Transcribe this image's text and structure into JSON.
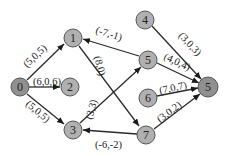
{
  "diagram": {
    "type": "directed-graph",
    "colors": {
      "node_fill": "#b0b0b0",
      "node_fill_highlight": "#909090",
      "edge": "#2a2a2a",
      "background": "#ffffff"
    },
    "nodes": [
      {
        "id": "n0",
        "label": "0",
        "x": 20,
        "y": 87,
        "highlight": true
      },
      {
        "id": "n1",
        "label": "1",
        "x": 73,
        "y": 38,
        "highlight": false
      },
      {
        "id": "n2",
        "label": "2",
        "x": 70,
        "y": 87,
        "highlight": false
      },
      {
        "id": "n3",
        "label": "3",
        "x": 73,
        "y": 130,
        "highlight": false
      },
      {
        "id": "n4",
        "label": "4",
        "x": 145,
        "y": 20,
        "highlight": false
      },
      {
        "id": "n5a",
        "label": "5",
        "x": 148,
        "y": 60,
        "highlight": false
      },
      {
        "id": "n6",
        "label": "6",
        "x": 148,
        "y": 98,
        "highlight": false
      },
      {
        "id": "n7",
        "label": "7",
        "x": 146,
        "y": 135,
        "highlight": false
      },
      {
        "id": "n5b",
        "label": "5",
        "x": 208,
        "y": 87,
        "highlight": true
      }
    ],
    "edges": [
      {
        "from": "n0",
        "to": "n1",
        "label": "(5,0,5)"
      },
      {
        "from": "n0",
        "to": "n2",
        "label": "(6,0,6)"
      },
      {
        "from": "n0",
        "to": "n3",
        "label": "(5,0,5)"
      },
      {
        "from": "n5a",
        "to": "n1",
        "label": "(-7,-1)"
      },
      {
        "from": "n1",
        "to": "n7",
        "label": "(8,0)"
      },
      {
        "from": "n3",
        "to": "n5a",
        "label": "(3,3)"
      },
      {
        "from": "n7",
        "to": "n3",
        "label": "(-6,-2)"
      },
      {
        "from": "n4",
        "to": "n5b",
        "label": "(3,0,3)"
      },
      {
        "from": "n5a",
        "to": "n5b",
        "label": "(4,0,4)"
      },
      {
        "from": "n6",
        "to": "n5b",
        "label": "(7,0,7)"
      },
      {
        "from": "n7",
        "to": "n5b",
        "label": "(3,0,2)"
      }
    ]
  }
}
